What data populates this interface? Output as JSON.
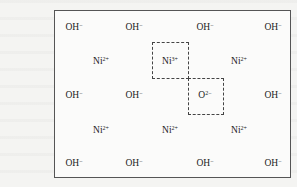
{
  "ions": [
    {
      "id": "oh-r1-c1",
      "symbol": "OH",
      "charge": "−",
      "row": 1,
      "col": 1
    },
    {
      "id": "oh-r1-c2",
      "symbol": "OH",
      "charge": "−",
      "row": 1,
      "col": 2
    },
    {
      "id": "oh-r1-c3",
      "symbol": "OH",
      "charge": "−",
      "row": 1,
      "col": 3
    },
    {
      "id": "oh-r1-c4",
      "symbol": "OH",
      "charge": "−",
      "row": 1,
      "col": 4
    },
    {
      "id": "ni-r2-c1",
      "symbol": "Ni",
      "charge": "2+",
      "row": 2,
      "col": 1
    },
    {
      "id": "ni-r2-c2",
      "symbol": "Ni",
      "charge": "3+",
      "row": 2,
      "col": 2,
      "highlighted": true
    },
    {
      "id": "ni-r2-c3",
      "symbol": "Ni",
      "charge": "2+",
      "row": 2,
      "col": 3
    },
    {
      "id": "oh-r3-c1",
      "symbol": "OH",
      "charge": "−",
      "row": 3,
      "col": 1
    },
    {
      "id": "oh-r3-c2",
      "symbol": "OH",
      "charge": "−",
      "row": 3,
      "col": 2
    },
    {
      "id": "o-r3-c3",
      "symbol": "O",
      "charge": "2−",
      "row": 3,
      "col": 3,
      "highlighted": true
    },
    {
      "id": "oh-r3-c4",
      "symbol": "OH",
      "charge": "−",
      "row": 3,
      "col": 4
    },
    {
      "id": "ni-r4-c1",
      "symbol": "Ni",
      "charge": "2+",
      "row": 4,
      "col": 1
    },
    {
      "id": "ni-r4-c2",
      "symbol": "Ni",
      "charge": "2+",
      "row": 4,
      "col": 2
    },
    {
      "id": "ni-r4-c3",
      "symbol": "Ni",
      "charge": "2+",
      "row": 4,
      "col": 3
    },
    {
      "id": "oh-r5-c1",
      "symbol": "OH",
      "charge": "−",
      "row": 5,
      "col": 1
    },
    {
      "id": "oh-r5-c2",
      "symbol": "OH",
      "charge": "−",
      "row": 5,
      "col": 2
    },
    {
      "id": "oh-r5-c3",
      "symbol": "OH",
      "charge": "−",
      "row": 5,
      "col": 3
    },
    {
      "id": "oh-r5-c4",
      "symbol": "OH",
      "charge": "−",
      "row": 5,
      "col": 4
    }
  ],
  "highlight_boxes": [
    {
      "id": "box-ni3",
      "encloses": "Ni3+",
      "style": "dashed"
    },
    {
      "id": "box-o2",
      "encloses": "O2-",
      "style": "dashed"
    }
  ]
}
